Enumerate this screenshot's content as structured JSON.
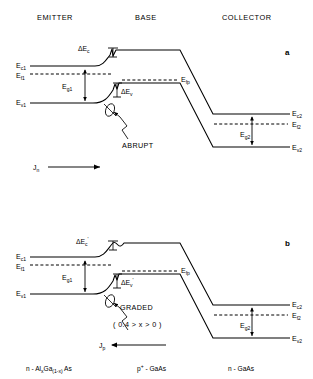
{
  "figure": {
    "headers": {
      "emitter": "EMITTER",
      "base": "BASE",
      "collector": "COLLECTOR"
    },
    "panels": [
      {
        "letter": "a",
        "junction_type": "ABRUPT",
        "current_label": "J",
        "current_sub": "n",
        "current_direction": "right",
        "delta_ec": "ΔE",
        "delta_ec_sub": "c",
        "delta_ec_prime": "",
        "delta_ev": "ΔE",
        "delta_ev_sub": "v",
        "delta_ev_prime": "",
        "levels": {
          "ec1": "E",
          "ec1_sub": "c1",
          "ef1": "E",
          "ef1_sub": "f1",
          "ev1": "E",
          "ev1_sub": "v1",
          "eg1": "E",
          "eg1_sub": "g1",
          "efp": "E",
          "efp_sub": "fp",
          "ec2": "E",
          "ec2_sub": "c2",
          "ef2": "E",
          "ef2_sub": "f2",
          "ev2": "E",
          "ev2_sub": "v2",
          "eg2": "E",
          "eg2_sub": "g2"
        }
      },
      {
        "letter": "b",
        "junction_type": "GRADED",
        "composition_note": "( 0.4 > x > 0 )",
        "current_label": "J",
        "current_sub": "p",
        "current_direction": "left",
        "delta_ec": "ΔE",
        "delta_ec_sub": "c",
        "delta_ec_prime": "'",
        "delta_ev": "ΔE",
        "delta_ev_sub": "v",
        "delta_ev_prime": "'",
        "levels": {
          "ec1": "E",
          "ec1_sub": "c1",
          "ef1": "E",
          "ef1_sub": "f1",
          "ev1": "E",
          "ev1_sub": "v1",
          "eg1": "E",
          "eg1_sub": "g1",
          "efp": "E",
          "efp_sub": "fp",
          "ec2": "E",
          "ec2_sub": "c2",
          "ef2": "E",
          "ef2_sub": "f2",
          "ev2": "E",
          "ev2_sub": "v2",
          "eg2": "E",
          "eg2_sub": "g2"
        }
      }
    ],
    "materials": {
      "emitter": "n - Al",
      "emitter_sub1": "x",
      "emitter_mid": "Ga",
      "emitter_sub2": "(1-x)",
      "emitter_end": "As",
      "base": "p",
      "base_sup": "+",
      "base_end": " - GaAs",
      "collector": "n - GaAs"
    },
    "colors": {
      "line": "#000000",
      "background": "#ffffff"
    }
  }
}
